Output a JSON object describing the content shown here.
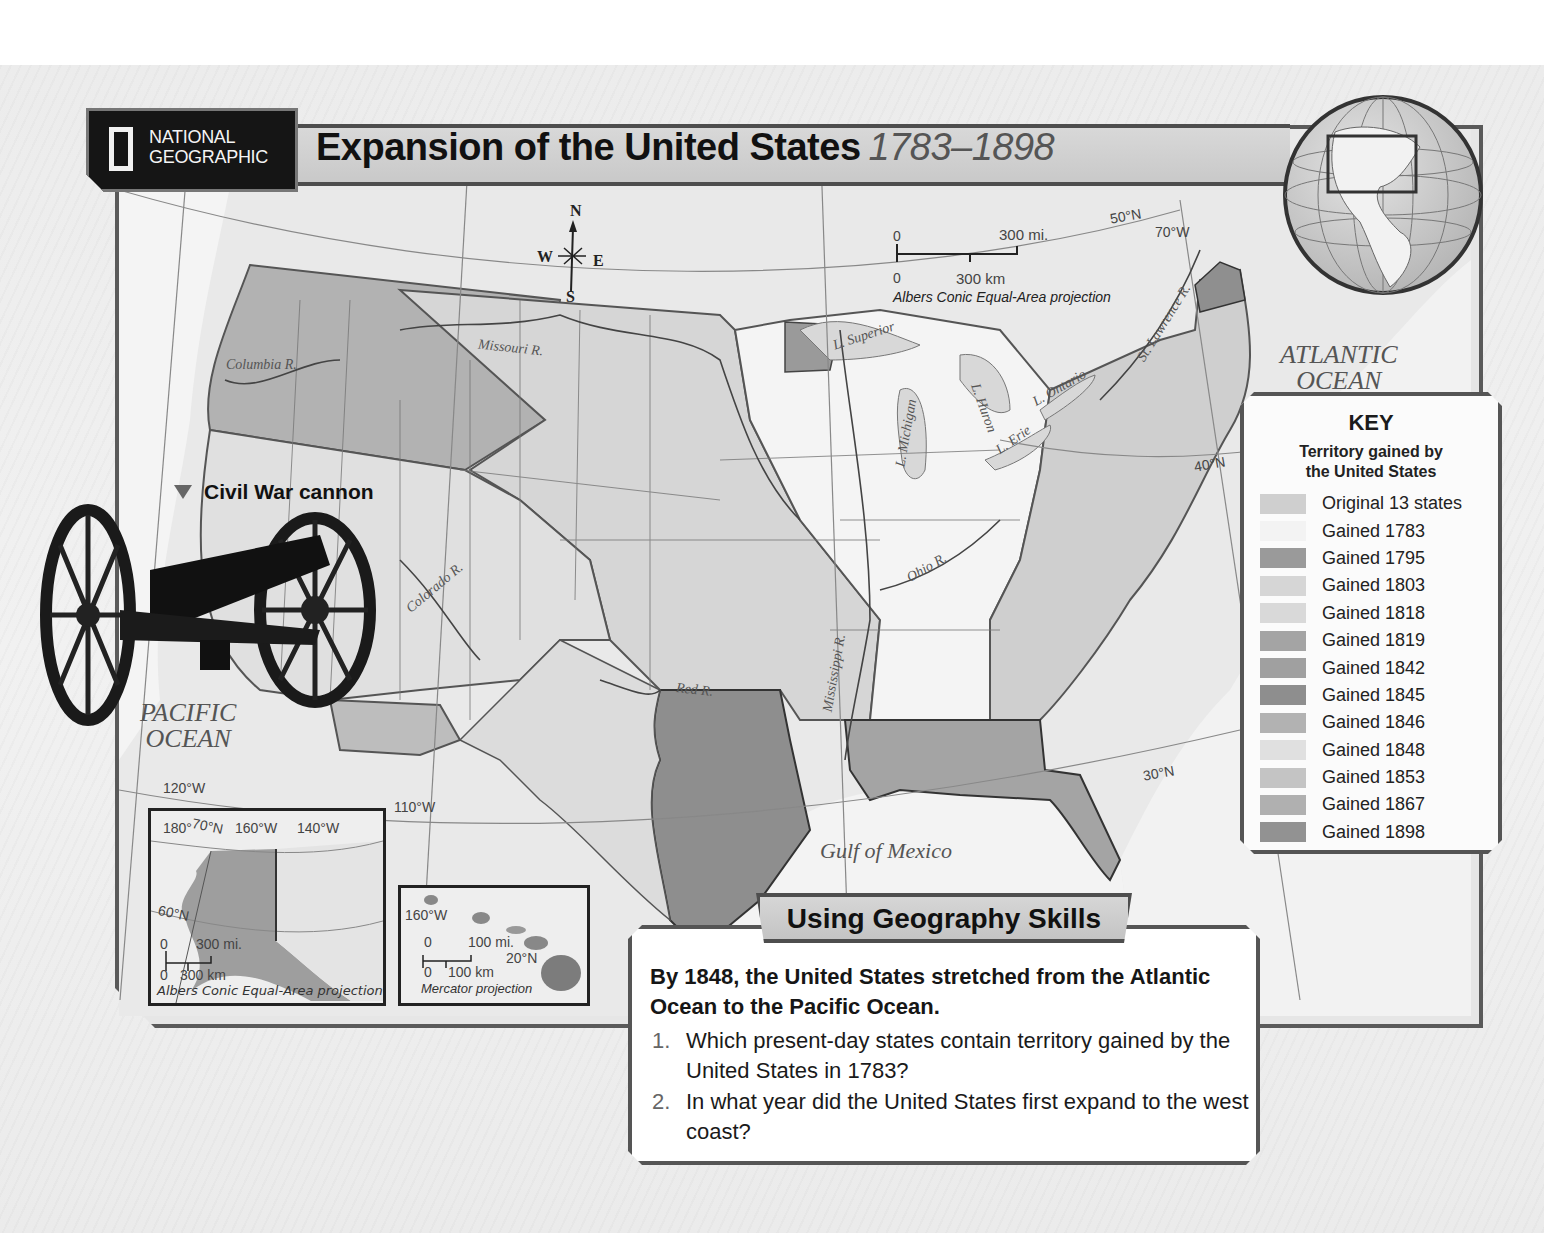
{
  "header": {
    "publisher_line1": "NATIONAL",
    "publisher_line2": "GEOGRAPHIC",
    "title": "Expansion of the United States",
    "years": "1783–1898"
  },
  "compass": {
    "n": "N",
    "s": "S",
    "e": "E",
    "w": "W"
  },
  "scale_main": {
    "mi_zero": "0",
    "mi_label": "300 mi.",
    "km_zero": "0",
    "km_label": "300 km",
    "projection": "Albers Conic Equal-Area projection"
  },
  "grid_labels": {
    "lat_50": "50°N",
    "lat_40": "40°N",
    "lat_30": "30°N",
    "lon_70": "70°W",
    "lon_110": "110°W",
    "lon_120": "120°W"
  },
  "water_labels": {
    "atlantic_1": "ATLANTIC",
    "atlantic_2": "OCEAN",
    "pacific_1": "PACIFIC",
    "pacific_2": "OCEAN",
    "gulf": "Gulf of Mexico"
  },
  "rivers": {
    "columbia": "Columbia R.",
    "missouri": "Missouri R.",
    "colorado": "Colorado R.",
    "red": "Red R.",
    "mississippi": "Mississippi R.",
    "ohio": "Ohio R.",
    "st_lawrence": "St. Lawrence R."
  },
  "lakes": {
    "superior": "L. Superior",
    "michigan": "L. Michigan",
    "huron": "L. Huron",
    "erie": "L. Erie",
    "ontario": "L. Ontario"
  },
  "photo_caption": "Civil War cannon",
  "inset_alaska": {
    "lon_180": "180°",
    "lat_70": "70°N",
    "lon_160": "160°W",
    "lon_140": "140°W",
    "lat_60": "60°N",
    "mi_zero": "0",
    "mi_label": "300 mi.",
    "km_zero": "0",
    "km_label": "300 km",
    "projection": "Albers Conic Equal-Area projection"
  },
  "inset_hawaii": {
    "lon_160": "160°W",
    "lat_20": "20°N",
    "mi_zero": "0",
    "mi_label": "100 mi.",
    "km_zero": "0",
    "km_label": "100 km",
    "projection": "Mercator projection"
  },
  "key": {
    "title": "KEY",
    "subtitle_1": "Territory gained by",
    "subtitle_2": "the United States",
    "items": [
      {
        "label": "Original 13 states",
        "color": "#cfcfcf"
      },
      {
        "label": "Gained 1783",
        "color": "#f3f3f3"
      },
      {
        "label": "Gained 1795",
        "color": "#9a9a9a"
      },
      {
        "label": "Gained 1803",
        "color": "#d6d6d6"
      },
      {
        "label": "Gained 1818",
        "color": "#d9d9d9"
      },
      {
        "label": "Gained 1819",
        "color": "#a4a4a4"
      },
      {
        "label": "Gained 1842",
        "color": "#a0a0a0"
      },
      {
        "label": "Gained 1845",
        "color": "#8e8e8e"
      },
      {
        "label": "Gained 1846",
        "color": "#b2b2b2"
      },
      {
        "label": "Gained 1848",
        "color": "#e0e0e0"
      },
      {
        "label": "Gained 1853",
        "color": "#c4c4c4"
      },
      {
        "label": "Gained 1867",
        "color": "#b0b0b0"
      },
      {
        "label": "Gained 1898",
        "color": "#929292"
      }
    ]
  },
  "skills": {
    "title": "Using Geography Skills",
    "lead": "By 1848, the United States stretched from the Atlantic Ocean to the Pacific Ocean.",
    "questions": [
      {
        "num": "1.",
        "text": "Which present-day states contain territory gained by the United States in 1783?"
      },
      {
        "num": "2.",
        "text": "In what year did the United States first expand to the west coast?"
      }
    ]
  }
}
